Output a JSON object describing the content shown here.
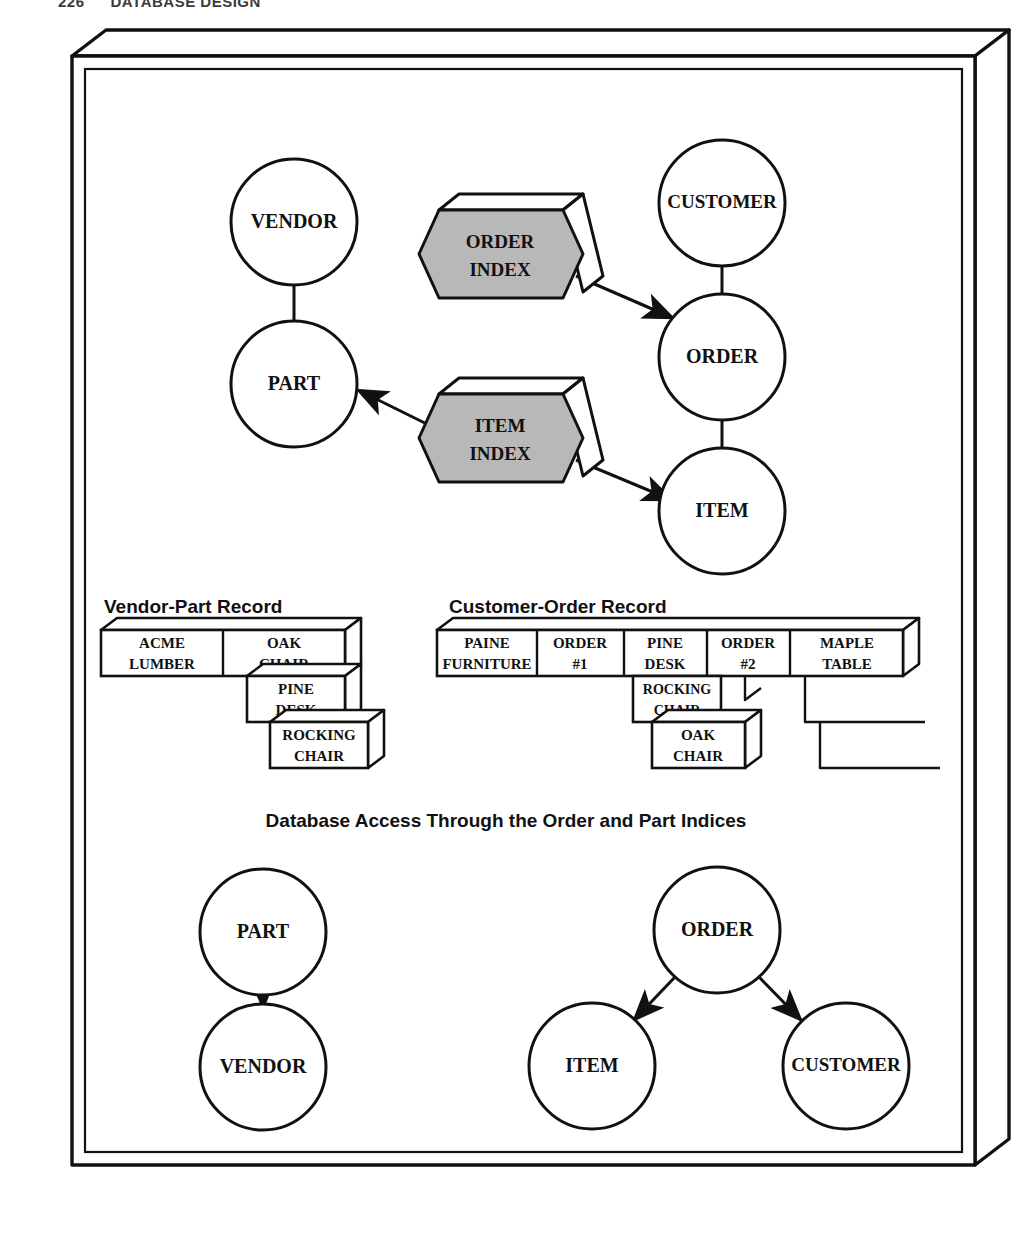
{
  "running_head": {
    "folio": "226",
    "title": "DATABASE DESIGN"
  },
  "figure": {
    "top_diagram": {
      "name": "Index access diagram",
      "nodes": [
        {
          "id": "vendor",
          "label": "VENDOR",
          "cx": 294,
          "cy": 222,
          "r": 63
        },
        {
          "id": "part",
          "label": "PART",
          "cx": 294,
          "cy": 384,
          "r": 63
        },
        {
          "id": "customer",
          "label": "CUSTOMER",
          "cx": 722,
          "cy": 203,
          "r": 63
        },
        {
          "id": "order",
          "label": "ORDER",
          "cx": 722,
          "cy": 357,
          "r": 63
        },
        {
          "id": "item",
          "label": "ITEM",
          "cx": 722,
          "cy": 511,
          "r": 63
        }
      ],
      "indices": [
        {
          "id": "order-index",
          "label_line1": "ORDER",
          "label_line2": "INDEX",
          "cx": 500,
          "cy": 254
        },
        {
          "id": "item-index",
          "label_line1": "ITEM",
          "label_line2": "INDEX",
          "cx": 500,
          "cy": 438
        }
      ],
      "links": [
        {
          "from": "vendor",
          "to": "part",
          "type": "line"
        },
        {
          "from": "customer",
          "to": "order",
          "type": "line"
        },
        {
          "from": "order",
          "to": "item",
          "type": "line"
        },
        {
          "from": "order-index",
          "to": "order",
          "type": "arrow"
        },
        {
          "from": "item-index",
          "to": "part",
          "type": "arrow"
        },
        {
          "from": "item-index",
          "to": "item",
          "type": "arrow"
        }
      ]
    },
    "records": [
      {
        "id": "vendor-part-record",
        "title": "Vendor-Part Record",
        "rows": [
          {
            "cells": [
              {
                "line1": "ACME",
                "line2": "LUMBER"
              },
              {
                "line1": "OAK",
                "line2": "CHAIR"
              }
            ]
          },
          {
            "cells": [
              {
                "line1": "PINE",
                "line2": "DESK"
              }
            ]
          },
          {
            "cells": [
              {
                "line1": "ROCKING",
                "line2": "CHAIR"
              }
            ]
          }
        ]
      },
      {
        "id": "customer-order-record",
        "title": "Customer-Order Record",
        "rows": [
          {
            "cells": [
              {
                "line1": "PAINE",
                "line2": "FURNITURE"
              },
              {
                "line1": "ORDER",
                "line2": "#1"
              },
              {
                "line1": "PINE",
                "line2": "DESK"
              },
              {
                "line1": "ORDER",
                "line2": "#2"
              },
              {
                "line1": "MAPLE",
                "line2": "TABLE"
              }
            ]
          },
          {
            "cells": [
              {
                "line1": "ROCKING",
                "line2": "CHAIR"
              }
            ]
          },
          {
            "cells": [
              {
                "line1": "OAK",
                "line2": "CHAIR"
              }
            ]
          }
        ]
      }
    ],
    "caption": "Database Access Through the Order and Part Indices",
    "bottom_diagrams": [
      {
        "id": "part-vendor-access",
        "nodes": [
          {
            "id": "part2",
            "label": "PART",
            "cx": 263,
            "cy": 932,
            "r": 63
          },
          {
            "id": "vendor2",
            "label": "VENDOR",
            "cx": 263,
            "cy": 1067,
            "r": 63
          }
        ],
        "links": [
          {
            "from": "part2",
            "to": "vendor2",
            "type": "arrow"
          }
        ]
      },
      {
        "id": "order-item-customer-access",
        "nodes": [
          {
            "id": "order2",
            "label": "ORDER",
            "cx": 717,
            "cy": 930,
            "r": 63
          },
          {
            "id": "item2",
            "label": "ITEM",
            "cx": 592,
            "cy": 1066,
            "r": 63
          },
          {
            "id": "customer2",
            "label": "CUSTOMER",
            "cx": 846,
            "cy": 1066,
            "r": 63
          }
        ],
        "links": [
          {
            "from": "order2",
            "to": "item2",
            "type": "arrow"
          },
          {
            "from": "order2",
            "to": "customer2",
            "type": "arrow"
          }
        ]
      }
    ]
  },
  "colors": {
    "ink": "#111111",
    "index_fill": "#b8b8b8",
    "paper": "#ffffff"
  }
}
